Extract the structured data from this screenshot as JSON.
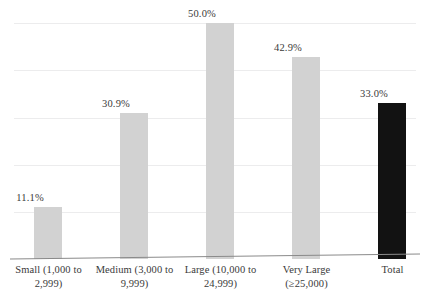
{
  "chart_data": {
    "type": "bar",
    "title": "",
    "subtitle": "",
    "xlabel": "",
    "ylabel": "",
    "ylim": [
      0,
      50
    ],
    "grid": true,
    "gridline_values": [
      0,
      10,
      20,
      30,
      40,
      50
    ],
    "legend": "none",
    "categories": [
      "Small (1,000 to 2,999)",
      "Medium (3,000 to 9,999)",
      "Large (10,000 to 24,999)",
      "Very Large (≥25,000)",
      "Total"
    ],
    "category_lines": [
      [
        "Small (1,000 to",
        "2,999)"
      ],
      [
        "Medium (3,000 to",
        "9,999)"
      ],
      [
        "Large (10,000 to",
        "24,999)"
      ],
      [
        "Very Large",
        "(≥25,000)"
      ],
      [
        "Total",
        ""
      ]
    ],
    "values": [
      11.1,
      30.9,
      50.0,
      42.9,
      33.0
    ],
    "data_labels": [
      "11.1%",
      "30.9%",
      "50.0%",
      "42.9%",
      "33.0%"
    ],
    "bar_colors": [
      "#d2d2d2",
      "#d2d2d2",
      "#d2d2d2",
      "#d2d2d2",
      "#121212"
    ],
    "accent_color": "#121212",
    "series_color": "#d2d2d2",
    "gridline_color": "#ececed",
    "axis_color": "#8a8a8a",
    "text_color": "#3a3a3a"
  }
}
